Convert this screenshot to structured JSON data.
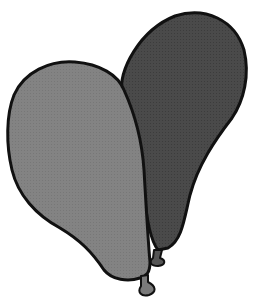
{
  "scene": {
    "subject": "two balloons",
    "background_color": "#ffffff",
    "outline_color": "#111111",
    "balloons": [
      {
        "position": "back-right",
        "fill": "#4a4a4a",
        "knot_fill": "#555555"
      },
      {
        "position": "front-left",
        "fill": "#828282",
        "knot_fill": "#7a7a7a"
      }
    ]
  }
}
